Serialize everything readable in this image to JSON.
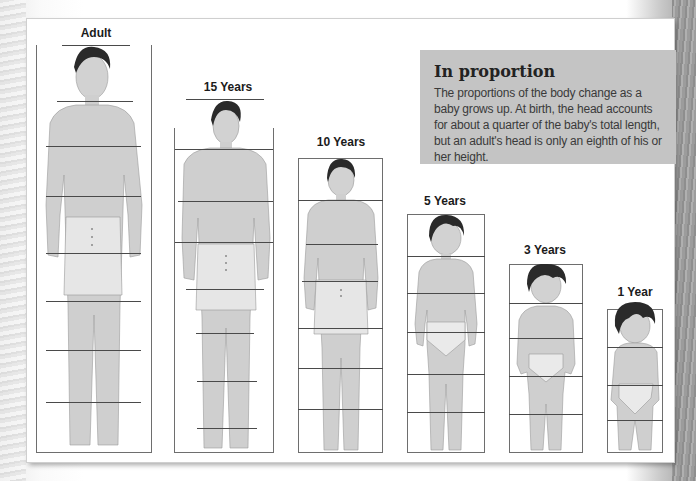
{
  "info_box": {
    "title": "In proportion",
    "body": "The proportions of the body change as a baby grows up. At birth, the head accounts for about a quarter of the baby's total length, but an adult's head is only an eighth of his or her height."
  },
  "figures": [
    {
      "label": "Adult",
      "head_units": 8
    },
    {
      "label": "15 Years",
      "head_units": 7.5
    },
    {
      "label": "10 Years",
      "head_units": 7
    },
    {
      "label": "5 Years",
      "head_units": 6
    },
    {
      "label": "3 Years",
      "head_units": 5
    },
    {
      "label": "1 Year",
      "head_units": 4
    }
  ],
  "colors": {
    "skin": "#cfcfcf",
    "hair": "#2a2a2a",
    "info_box": "#c4c4c4",
    "frame": "#6e6e6e"
  }
}
